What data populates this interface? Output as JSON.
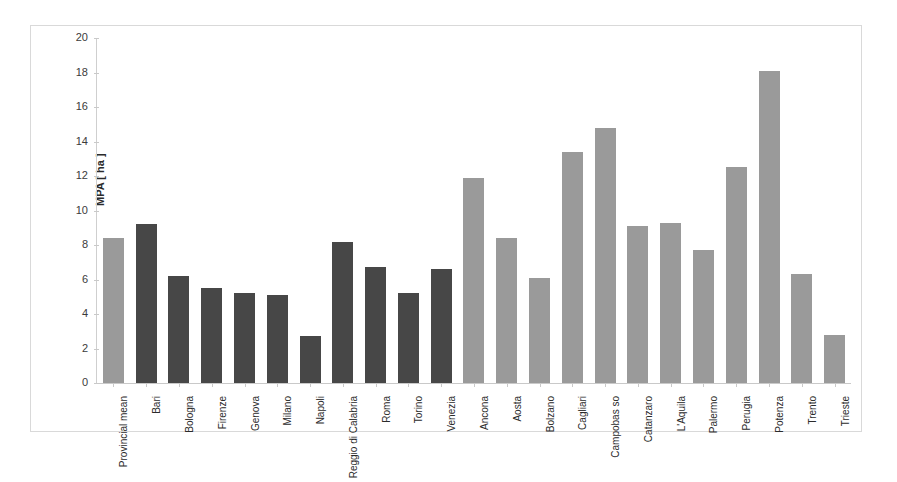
{
  "chart_data": {
    "type": "bar",
    "title": "",
    "xlabel": "",
    "ylabel": "MPA [ ha ]",
    "ylim": [
      0,
      20
    ],
    "yticks": [
      0,
      2,
      4,
      6,
      8,
      10,
      12,
      14,
      16,
      18,
      20
    ],
    "grid": false,
    "legend": "none",
    "categories": [
      "Provincial mean",
      "Bari",
      "Bologna",
      "Firenze",
      "Genova",
      "Milano",
      "Napoli",
      "Reggio di Calabria",
      "Roma",
      "Torino",
      "Venezia",
      "Ancona",
      "Aosta",
      "Bolzano",
      "Cagliari",
      "Campobas so",
      "Catanzaro",
      "L'Aquila",
      "Palermo",
      "Perugia",
      "Potenza",
      "Trento",
      "Trieste"
    ],
    "values": [
      8.4,
      9.2,
      6.2,
      5.5,
      5.2,
      5.1,
      2.7,
      8.2,
      6.7,
      5.2,
      6.6,
      11.9,
      8.4,
      6.1,
      13.4,
      14.8,
      9.1,
      9.3,
      7.7,
      12.5,
      18.1,
      6.3,
      2.8
    ],
    "bar_colors": [
      "light",
      "dark",
      "dark",
      "dark",
      "dark",
      "dark",
      "dark",
      "dark",
      "dark",
      "dark",
      "dark",
      "light",
      "light",
      "light",
      "light",
      "light",
      "light",
      "light",
      "light",
      "light",
      "light",
      "light",
      "light"
    ],
    "colors": {
      "light": "#9a9a9a",
      "dark": "#474747",
      "axis": "#c9c9c9",
      "frame": "#d9d9d9",
      "text": "#2b2b2b",
      "background": "#ffffff"
    }
  }
}
